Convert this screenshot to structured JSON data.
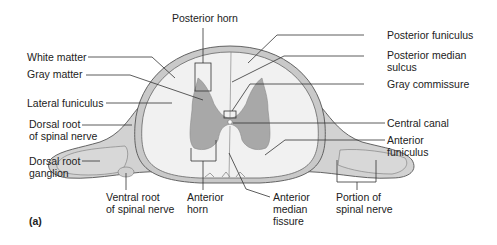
{
  "figure": {
    "panel_label": "(a)",
    "colors": {
      "white_matter": "#f1f1f1",
      "gray_matter": "#a8a8a8",
      "outline": "#555555",
      "meninges": "#c9c9c9",
      "nerve": "#d2d2d2",
      "text": "#222222"
    }
  },
  "labels": {
    "posterior_horn": "Posterior horn",
    "white_matter": "White matter",
    "gray_matter": "Gray matter",
    "lateral_funiculus": "Lateral funiculus",
    "dorsal_root_spinal_nerve": [
      "Dorsal root",
      "of spinal nerve"
    ],
    "dorsal_root_ganglion": [
      "Dorsal root",
      "ganglion"
    ],
    "ventral_root_spinal_nerve": [
      "Ventral root",
      "of spinal nerve"
    ],
    "anterior_horn": [
      "Anterior",
      "horn"
    ],
    "anterior_median_fissure": [
      "Anterior",
      "median",
      "fissure"
    ],
    "portion_of_spinal_nerve": [
      "Portion of",
      "spinal nerve"
    ],
    "posterior_funiculus": "Posterior funiculus",
    "posterior_median_sulcus": [
      "Posterior median",
      "sulcus"
    ],
    "gray_commissure": "Gray commissure",
    "central_canal": "Central canal",
    "anterior_funiculus": [
      "Anterior",
      "funiculus"
    ]
  }
}
